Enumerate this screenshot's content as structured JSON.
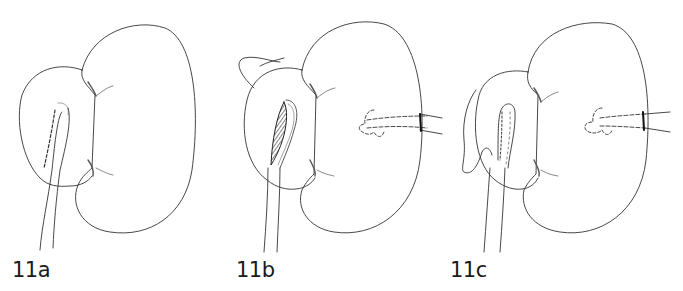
{
  "figure": {
    "panels": [
      {
        "id": "11a",
        "label": "11a",
        "shows_pyelotomy_incision": false,
        "shows_nephrostomy_tube": false
      },
      {
        "id": "11b",
        "label": "11b",
        "shows_pyelotomy_incision": true,
        "shows_nephrostomy_tube": true
      },
      {
        "id": "11c",
        "label": "11c",
        "shows_pyelotomy_incision": false,
        "shows_nephrostomy_tube": true,
        "shows_sutured_closure": true
      }
    ],
    "colors": {
      "line": "#333333",
      "background": "#ffffff",
      "hatch": "#444444"
    }
  }
}
